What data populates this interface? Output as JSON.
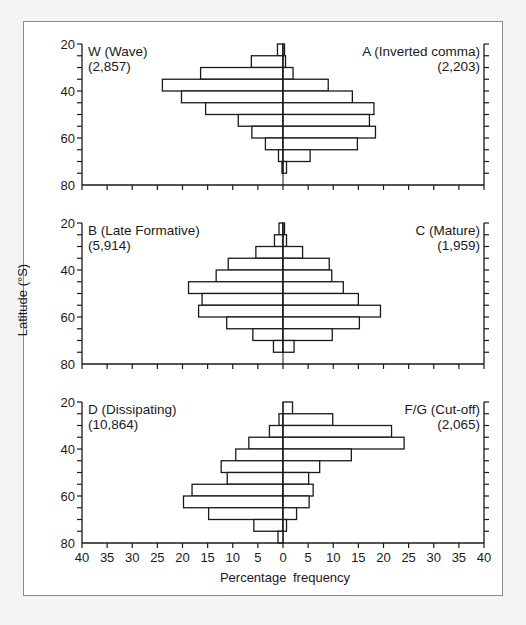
{
  "figure": {
    "ylabel": "Latitude (°S)",
    "xlabel": "Percentage frequency",
    "x_tick_labels": [
      "40",
      "35",
      "30",
      "25",
      "20",
      "15",
      "10",
      "5",
      "0",
      "5",
      "10",
      "15",
      "20",
      "25",
      "30",
      "35",
      "40"
    ],
    "y_tick_labels": [
      "20",
      "40",
      "60",
      "80"
    ]
  },
  "chart_data": {
    "type": "bar",
    "orientation": "horizontal-back-to-back",
    "xlabel": "Percentage frequency",
    "ylabel": "Latitude (°S)",
    "xlim": [
      -40,
      40
    ],
    "ylim": [
      20,
      80
    ],
    "x_ticks": [
      -40,
      -35,
      -30,
      -25,
      -20,
      -15,
      -10,
      -5,
      0,
      5,
      10,
      15,
      20,
      25,
      30,
      35,
      40
    ],
    "y_ticks": [
      20,
      40,
      60,
      80
    ],
    "latitude_bands": [
      "20-25",
      "25-30",
      "30-35",
      "35-40",
      "40-45",
      "45-50",
      "50-55",
      "55-60",
      "60-65",
      "65-70",
      "70-75",
      "75-80"
    ],
    "grid": false,
    "panels": [
      {
        "left": {
          "name": "W (Wave)",
          "count": "(2,857)",
          "values": [
            1.1,
            6.3,
            16.4,
            24.0,
            20.2,
            15.4,
            8.9,
            6.2,
            3.5,
            0.9,
            0.2,
            0
          ]
        },
        "right": {
          "name": "A (Inverted comma)",
          "count": "(2,203)",
          "values": [
            0.3,
            0.5,
            2.0,
            9.0,
            13.8,
            18.1,
            17.2,
            18.4,
            14.8,
            5.4,
            0.7,
            0
          ]
        }
      },
      {
        "left": {
          "name": "B (Late Formative)",
          "count": "(5,914)",
          "values": [
            0.8,
            1.7,
            5.4,
            10.9,
            13.3,
            18.8,
            16.1,
            16.8,
            11.2,
            6.0,
            1.9,
            0
          ]
        },
        "right": {
          "name": "C (Mature)",
          "count": "(1,959)",
          "values": [
            0.3,
            0.7,
            3.9,
            9.2,
            9.7,
            12.0,
            15.0,
            19.4,
            15.2,
            9.8,
            2.2,
            0
          ]
        }
      },
      {
        "left": {
          "name": "D (Dissipating)",
          "count": "(10,864)",
          "values": [
            0,
            0.8,
            2.7,
            6.8,
            9.4,
            12.3,
            11.1,
            18.1,
            19.8,
            14.8,
            5.8,
            1.0
          ]
        },
        "right": {
          "name": "F/G (Cut-off)",
          "count": "(2,065)",
          "values": [
            1.9,
            9.9,
            21.6,
            24.1,
            13.6,
            7.3,
            5.1,
            6.0,
            5.2,
            2.7,
            0.7,
            0
          ]
        }
      }
    ]
  },
  "colors": {
    "ink": "#1a1a1a",
    "frame": "#8a8a8a",
    "bar_fill": "#ffffff"
  }
}
